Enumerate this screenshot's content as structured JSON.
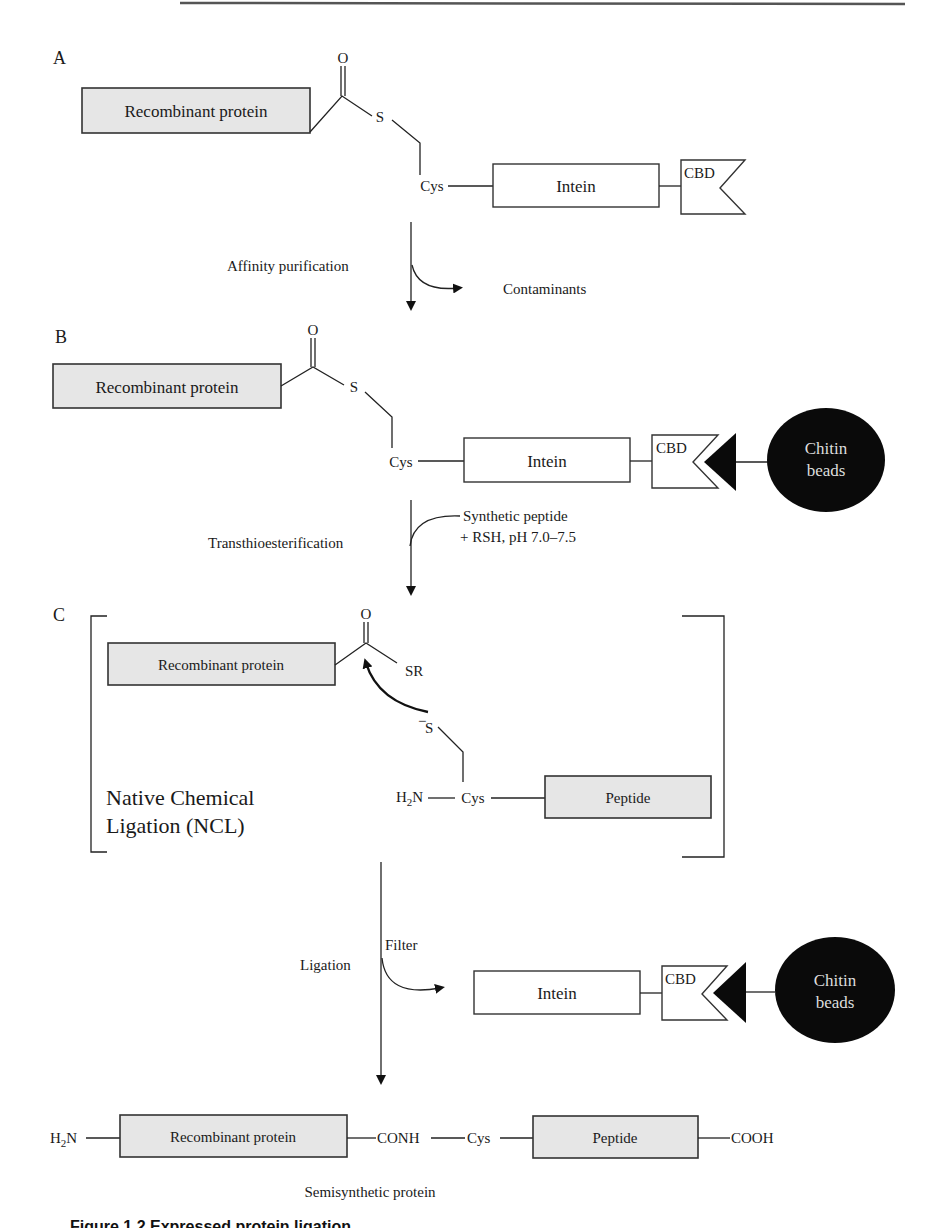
{
  "header_rule": true,
  "panels": {
    "A": {
      "letter": "A",
      "recombinant_protein": "Recombinant protein",
      "carbonyl_O": "O",
      "thioester_S": "S",
      "cys": "Cys",
      "intein": "Intein",
      "cbd": "CBD"
    },
    "step1": {
      "label": "Affinity purification",
      "side_product": "Contaminants"
    },
    "B": {
      "letter": "B",
      "recombinant_protein": "Recombinant protein",
      "carbonyl_O": "O",
      "thioester_S": "S",
      "cys": "Cys",
      "intein": "Intein",
      "cbd": "CBD",
      "beads_line1": "Chitin",
      "beads_line2": "beads"
    },
    "step2": {
      "label": "Transthioesterification",
      "reagent_line1": "Synthetic peptide",
      "reagent_line2": "+ RSH, pH 7.0–7.5"
    },
    "C": {
      "letter": "C",
      "recombinant_protein": "Recombinant protein",
      "carbonyl_O": "O",
      "leaving_group": "SR",
      "thiolate": "S",
      "thiolate_charge": "−",
      "amine": "H",
      "amine_sub": "2",
      "amine_N": "N",
      "cys": "Cys",
      "peptide": "Peptide",
      "ncl_line1": "Native Chemical",
      "ncl_line2": "Ligation (NCL)"
    },
    "step3": {
      "label": "Ligation",
      "side_label": "Filter",
      "intein": "Intein",
      "cbd": "CBD",
      "beads_line1": "Chitin",
      "beads_line2": "beads"
    },
    "product": {
      "amine": "H",
      "amine_sub": "2",
      "amine_N": "N",
      "recombinant_protein": "Recombinant protein",
      "amide": "CONH",
      "cys": "Cys",
      "peptide": "Peptide",
      "carboxyl": "COOH",
      "name": "Semisynthetic protein"
    }
  },
  "caption": "Figure 1.2   Expressed protein ligation..."
}
